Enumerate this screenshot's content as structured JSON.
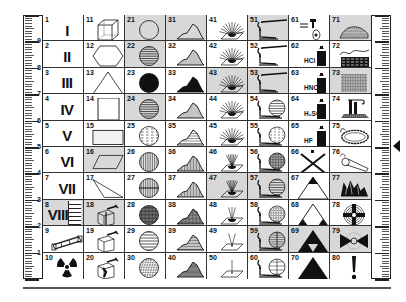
{
  "chart_data": {
    "type": "table",
    "columns": 8,
    "rows": 10,
    "ruler_labels_left": [
      "9",
      "8",
      "7",
      "6",
      "5",
      "4",
      "3",
      "2",
      "1"
    ],
    "ruler_labels_right": [
      "9",
      "8",
      "7",
      "6",
      "5",
      "4",
      "3",
      "2",
      "1"
    ]
  },
  "rulers": {
    "left": {
      "labels": [
        "9",
        "8",
        "7",
        "6",
        "5",
        "4",
        "3",
        "2",
        "1"
      ]
    },
    "right": {
      "labels": [
        "9",
        "8",
        "7",
        "6",
        "5",
        "4",
        "3",
        "2",
        "1"
      ]
    }
  },
  "marker": {
    "icon": "triangle-left-marker-icon"
  },
  "cells": [
    {
      "n": "1",
      "label": "I",
      "icon": "roman-numeral",
      "shaded": false
    },
    {
      "n": "2",
      "label": "II",
      "icon": "roman-numeral",
      "shaded": false
    },
    {
      "n": "3",
      "label": "III",
      "icon": "roman-numeral",
      "shaded": false
    },
    {
      "n": "4",
      "label": "IV",
      "icon": "roman-numeral",
      "shaded": false
    },
    {
      "n": "5",
      "label": "V",
      "icon": "roman-numeral",
      "shaded": false
    },
    {
      "n": "6",
      "label": "VI",
      "icon": "roman-numeral",
      "shaded": false
    },
    {
      "n": "7",
      "label": "VII",
      "icon": "roman-numeral",
      "shaded": false
    },
    {
      "n": "8",
      "label": "VIII",
      "icon": "roman-numeral",
      "shaded": true
    },
    {
      "n": "9",
      "label": "",
      "icon": "tube-icon",
      "shaded": false
    },
    {
      "n": "10",
      "label": "",
      "icon": "radiation-icon",
      "shaded": false
    },
    {
      "n": "11",
      "label": "",
      "icon": "cube-icon",
      "shaded": false
    },
    {
      "n": "12",
      "label": "",
      "icon": "hexagon-icon",
      "shaded": false
    },
    {
      "n": "13",
      "label": "",
      "icon": "triangle-outline-icon",
      "shaded": false
    },
    {
      "n": "14",
      "label": "",
      "icon": "square-icon",
      "shaded": false
    },
    {
      "n": "15",
      "label": "",
      "icon": "rectangle-icon",
      "shaded": false
    },
    {
      "n": "16",
      "label": "",
      "icon": "parallelogram-icon",
      "shaded": true
    },
    {
      "n": "17",
      "label": "",
      "icon": "obtuse-triangle-icon",
      "shaded": false
    },
    {
      "n": "18",
      "label": "",
      "icon": "split-box-hammer-icon",
      "shaded": true
    },
    {
      "n": "19",
      "label": "",
      "icon": "box-hammer-icon",
      "shaded": false
    },
    {
      "n": "20",
      "label": "",
      "icon": "broken-box-hammer-icon",
      "shaded": false
    },
    {
      "n": "21",
      "label": "",
      "icon": "circle-empty-icon",
      "shaded": true
    },
    {
      "n": "22",
      "label": "",
      "icon": "circle-horizontal-lines-icon",
      "shaded": true
    },
    {
      "n": "23",
      "label": "",
      "icon": "circle-filled-icon",
      "shaded": false
    },
    {
      "n": "24",
      "label": "",
      "icon": "circle-horizontal-lines-icon",
      "shaded": true
    },
    {
      "n": "25",
      "label": "",
      "icon": "circle-dashed-lines-icon",
      "shaded": false
    },
    {
      "n": "26",
      "label": "",
      "icon": "circle-vertical-lines-icon",
      "shaded": false
    },
    {
      "n": "27",
      "label": "",
      "icon": "circle-vertical-split-icon",
      "shaded": false
    },
    {
      "n": "28",
      "label": "",
      "icon": "circle-crosshatch-icon",
      "shaded": false
    },
    {
      "n": "29",
      "label": "",
      "icon": "circle-wide-lines-icon",
      "shaded": false
    },
    {
      "n": "30",
      "label": "",
      "icon": "circle-speckled-icon",
      "shaded": false
    },
    {
      "n": "31",
      "label": "",
      "icon": "mountain-outline-icon",
      "shaded": true
    },
    {
      "n": "32",
      "label": "",
      "icon": "mountain-lines-icon",
      "shaded": false
    },
    {
      "n": "33",
      "label": "",
      "icon": "mountain-filled-icon",
      "shaded": false
    },
    {
      "n": "34",
      "label": "",
      "icon": "mountain-lines-icon",
      "shaded": false
    },
    {
      "n": "35",
      "label": "",
      "icon": "mountain-dashed-icon",
      "shaded": false
    },
    {
      "n": "36",
      "label": "",
      "icon": "mountain-vertical-lines-icon",
      "shaded": false
    },
    {
      "n": "37",
      "label": "",
      "icon": "mountain-vertical-lines-icon",
      "shaded": false
    },
    {
      "n": "38",
      "label": "",
      "icon": "mountain-crosshatch-icon",
      "shaded": false
    },
    {
      "n": "39",
      "label": "",
      "icon": "mountain-stripes-icon",
      "shaded": false
    },
    {
      "n": "40",
      "label": "",
      "icon": "mountain-speckled-icon",
      "shaded": false
    },
    {
      "n": "41",
      "label": "",
      "icon": "burst-plane-icon",
      "shaded": false
    },
    {
      "n": "42",
      "label": "",
      "icon": "burst-plane-icon",
      "shaded": false
    },
    {
      "n": "43",
      "label": "",
      "icon": "burst-plane-icon",
      "shaded": true
    },
    {
      "n": "44",
      "label": "",
      "icon": "burst-plane-icon",
      "shaded": false
    },
    {
      "n": "45",
      "label": "",
      "icon": "burst-plane-icon",
      "shaded": false
    },
    {
      "n": "46",
      "label": "",
      "icon": "narrow-burst-plane-icon",
      "shaded": false
    },
    {
      "n": "47",
      "label": "",
      "icon": "narrow-burst-plane-icon",
      "shaded": true
    },
    {
      "n": "48",
      "label": "",
      "icon": "few-rays-plane-icon",
      "shaded": false
    },
    {
      "n": "49",
      "label": "",
      "icon": "two-rays-plane-icon",
      "shaded": false
    },
    {
      "n": "50",
      "label": "",
      "icon": "single-ray-plane-icon",
      "shaded": false
    },
    {
      "n": "51",
      "label": "",
      "icon": "torch-icon",
      "shaded": true
    },
    {
      "n": "52",
      "label": "",
      "icon": "torch-icon",
      "shaded": false
    },
    {
      "n": "53",
      "label": "",
      "icon": "torch-icon",
      "shaded": true
    },
    {
      "n": "54",
      "label": "",
      "icon": "torch-circle-lines-icon",
      "shaded": false
    },
    {
      "n": "55",
      "label": "",
      "icon": "torch-circle-dashed-icon",
      "shaded": false
    },
    {
      "n": "56",
      "label": "",
      "icon": "torch-circle-crosshatch-icon",
      "shaded": false
    },
    {
      "n": "57",
      "label": "",
      "icon": "torch-circle-lines-icon",
      "shaded": true
    },
    {
      "n": "58",
      "label": "",
      "icon": "torch-circle-speckled-icon",
      "shaded": false
    },
    {
      "n": "59",
      "label": "",
      "icon": "torch-circle-split-icon",
      "shaded": true
    },
    {
      "n": "60",
      "label": "",
      "icon": "torch-circle-grid-icon",
      "shaded": false
    },
    {
      "n": "61",
      "label": "",
      "icon": "dropper-icon",
      "shaded": false
    },
    {
      "n": "62",
      "label": "HCl",
      "icon": "acid-bottle-icon",
      "shaded": false
    },
    {
      "n": "63",
      "label": "HNO₃",
      "icon": "acid-bottle-icon",
      "shaded": false
    },
    {
      "n": "64",
      "label": "H₂SO₄",
      "icon": "acid-bottle-icon",
      "shaded": false
    },
    {
      "n": "65",
      "label": "HF",
      "icon": "acid-bottle-icon",
      "shaded": false
    },
    {
      "n": "66",
      "label": "",
      "icon": "cross-x-icon",
      "shaded": false
    },
    {
      "n": "67",
      "label": "",
      "icon": "triangle-top-filled-icon",
      "shaded": false
    },
    {
      "n": "68",
      "label": "",
      "icon": "triangle-bottom-corners-filled-icon",
      "shaded": false
    },
    {
      "n": "69",
      "label": "",
      "icon": "triforce-icon",
      "shaded": true
    },
    {
      "n": "70",
      "label": "",
      "icon": "triangle-filled-icon",
      "shaded": false
    },
    {
      "n": "71",
      "label": "",
      "icon": "layered-mound-icon",
      "shaded": true
    },
    {
      "n": "72",
      "label": "",
      "icon": "rock-layers-icon",
      "shaded": false
    },
    {
      "n": "73",
      "label": "",
      "icon": "striped-block-icon",
      "shaded": true
    },
    {
      "n": "74",
      "label": "",
      "icon": "pillar-structure-icon",
      "shaded": false
    },
    {
      "n": "75",
      "label": "",
      "icon": "ring-loop-icon",
      "shaded": false
    },
    {
      "n": "76",
      "label": "",
      "icon": "whistle-icon",
      "shaded": false
    },
    {
      "n": "77",
      "label": "",
      "icon": "crystal-cluster-icon",
      "shaded": true
    },
    {
      "n": "78",
      "label": "",
      "icon": "crosshair-target-icon",
      "shaded": false
    },
    {
      "n": "79",
      "label": "",
      "icon": "bowtie-sphere-icon",
      "shaded": true
    },
    {
      "n": "80",
      "label": "!",
      "icon": "exclamation-icon",
      "shaded": false
    }
  ]
}
